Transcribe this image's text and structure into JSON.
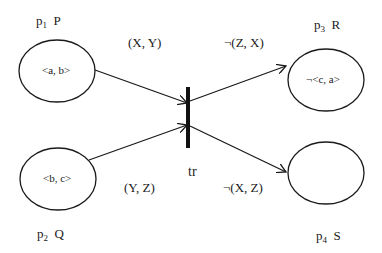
{
  "places": [
    {
      "id": "p1",
      "sub": "1",
      "name": "P",
      "token": "<a, b>"
    },
    {
      "id": "p2",
      "sub": "2",
      "name": "Q",
      "token": "<b, c>"
    },
    {
      "id": "p3",
      "sub": "3",
      "name": "R",
      "token": "¬<c, a>"
    },
    {
      "id": "p4",
      "sub": "4",
      "name": "S",
      "token": ""
    }
  ],
  "transition": {
    "label": "tr"
  },
  "arcs": [
    {
      "from": "p1",
      "to": "tr",
      "label": "(X, Y)"
    },
    {
      "from": "p2",
      "to": "tr",
      "label": "(Y, Z)"
    },
    {
      "from": "tr",
      "to": "p3",
      "label": "¬(Z, X)"
    },
    {
      "from": "tr",
      "to": "p4",
      "label": "¬(X, Z)"
    }
  ]
}
